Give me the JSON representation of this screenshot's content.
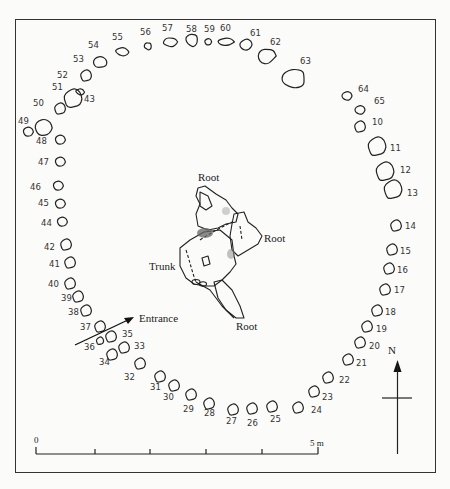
{
  "figure": {
    "type": "archaeological site plan"
  },
  "labels": {
    "root_top": "Root",
    "root_right": "Root",
    "root_bottom": "Root",
    "trunk": "Trunk",
    "entrance": "Entrance",
    "north": "N"
  },
  "scale_bar": {
    "start_label": "0",
    "end_label": "5 m",
    "divisions": 5
  },
  "stones": [
    {
      "id": "54",
      "x": 100,
      "y": 62,
      "lx": 88,
      "ly": 48
    },
    {
      "id": "55",
      "x": 122,
      "y": 52,
      "lx": 112,
      "ly": 40
    },
    {
      "id": "56",
      "x": 148,
      "y": 46,
      "lx": 140,
      "ly": 35
    },
    {
      "id": "57",
      "x": 170,
      "y": 42,
      "lx": 162,
      "ly": 31
    },
    {
      "id": "58",
      "x": 192,
      "y": 40,
      "lx": 186,
      "ly": 32
    },
    {
      "id": "59",
      "x": 208,
      "y": 42,
      "lx": 204,
      "ly": 32
    },
    {
      "id": "60",
      "x": 226,
      "y": 42,
      "lx": 220,
      "ly": 31
    },
    {
      "id": "61",
      "x": 246,
      "y": 45,
      "lx": 250,
      "ly": 36
    },
    {
      "id": "62",
      "x": 266,
      "y": 56,
      "lx": 270,
      "ly": 45
    },
    {
      "id": "63",
      "x": 294,
      "y": 78,
      "lx": 300,
      "ly": 64
    },
    {
      "id": "53",
      "x": 86,
      "y": 76,
      "lx": 73,
      "ly": 62
    },
    {
      "id": "52",
      "x": 73,
      "y": 99,
      "lx": 57,
      "ly": 78
    },
    {
      "id": "51",
      "x": 60,
      "y": 109,
      "lx": 52,
      "ly": 90
    },
    {
      "id": "43",
      "x": 80,
      "y": 92,
      "lx": 84,
      "ly": 102
    },
    {
      "id": "50",
      "x": 43,
      "y": 128,
      "lx": 33,
      "ly": 106
    },
    {
      "id": "49",
      "x": 28,
      "y": 132,
      "lx": 18,
      "ly": 124
    },
    {
      "id": "48",
      "x": 60,
      "y": 140,
      "lx": 36,
      "ly": 144
    },
    {
      "id": "47",
      "x": 60,
      "y": 162,
      "lx": 38,
      "ly": 165
    },
    {
      "id": "46",
      "x": 58,
      "y": 186,
      "lx": 30,
      "ly": 190
    },
    {
      "id": "45",
      "x": 60,
      "y": 204,
      "lx": 38,
      "ly": 206
    },
    {
      "id": "44",
      "x": 62,
      "y": 222,
      "lx": 41,
      "ly": 226
    },
    {
      "id": "42",
      "x": 66,
      "y": 245,
      "lx": 44,
      "ly": 250
    },
    {
      "id": "41",
      "x": 70,
      "y": 263,
      "lx": 49,
      "ly": 267
    },
    {
      "id": "40",
      "x": 70,
      "y": 284,
      "lx": 48,
      "ly": 287
    },
    {
      "id": "39",
      "x": 78,
      "y": 297,
      "lx": 61,
      "ly": 301
    },
    {
      "id": "38",
      "x": 86,
      "y": 311,
      "lx": 68,
      "ly": 315
    },
    {
      "id": "37",
      "x": 100,
      "y": 327,
      "lx": 80,
      "ly": 330
    },
    {
      "id": "36",
      "x": 100,
      "y": 341,
      "lx": 84,
      "ly": 350
    },
    {
      "id": "35",
      "x": 111,
      "y": 337,
      "lx": 122,
      "ly": 337
    },
    {
      "id": "34",
      "x": 112,
      "y": 355,
      "lx": 99,
      "ly": 365
    },
    {
      "id": "33",
      "x": 124,
      "y": 348,
      "lx": 134,
      "ly": 349
    },
    {
      "id": "32",
      "x": 140,
      "y": 364,
      "lx": 124,
      "ly": 380
    },
    {
      "id": "31",
      "x": 160,
      "y": 377,
      "lx": 150,
      "ly": 390
    },
    {
      "id": "30",
      "x": 174,
      "y": 386,
      "lx": 163,
      "ly": 400
    },
    {
      "id": "29",
      "x": 191,
      "y": 395,
      "lx": 183,
      "ly": 412
    },
    {
      "id": "28",
      "x": 209,
      "y": 404,
      "lx": 204,
      "ly": 416
    },
    {
      "id": "27",
      "x": 233,
      "y": 410,
      "lx": 226,
      "ly": 424
    },
    {
      "id": "26",
      "x": 252,
      "y": 409,
      "lx": 247,
      "ly": 426
    },
    {
      "id": "25",
      "x": 272,
      "y": 407,
      "lx": 270,
      "ly": 422
    },
    {
      "id": "24",
      "x": 298,
      "y": 408,
      "lx": 311,
      "ly": 413
    },
    {
      "id": "23",
      "x": 314,
      "y": 392,
      "lx": 322,
      "ly": 400
    },
    {
      "id": "22",
      "x": 328,
      "y": 378,
      "lx": 339,
      "ly": 383
    },
    {
      "id": "21",
      "x": 348,
      "y": 360,
      "lx": 356,
      "ly": 366
    },
    {
      "id": "20",
      "x": 360,
      "y": 343,
      "lx": 369,
      "ly": 349
    },
    {
      "id": "19",
      "x": 367,
      "y": 327,
      "lx": 376,
      "ly": 332
    },
    {
      "id": "18",
      "x": 377,
      "y": 311,
      "lx": 385,
      "ly": 315
    },
    {
      "id": "17",
      "x": 385,
      "y": 290,
      "lx": 394,
      "ly": 293
    },
    {
      "id": "16",
      "x": 389,
      "y": 269,
      "lx": 397,
      "ly": 273
    },
    {
      "id": "15",
      "x": 392,
      "y": 250,
      "lx": 400,
      "ly": 254
    },
    {
      "id": "14",
      "x": 396,
      "y": 226,
      "lx": 405,
      "ly": 229
    },
    {
      "id": "13",
      "x": 393,
      "y": 190,
      "lx": 407,
      "ly": 196
    },
    {
      "id": "12",
      "x": 385,
      "y": 172,
      "lx": 400,
      "ly": 173
    },
    {
      "id": "11",
      "x": 377,
      "y": 147,
      "lx": 390,
      "ly": 151
    },
    {
      "id": "10",
      "x": 360,
      "y": 127,
      "lx": 372,
      "ly": 125
    },
    {
      "id": "65",
      "x": 360,
      "y": 110,
      "lx": 374,
      "ly": 104
    },
    {
      "id": "64",
      "x": 347,
      "y": 96,
      "lx": 358,
      "ly": 92
    }
  ]
}
